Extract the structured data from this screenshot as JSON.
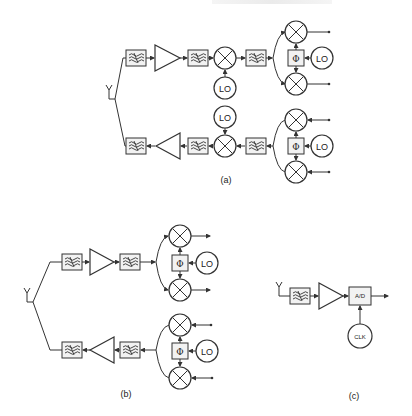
{
  "header_fragment": "",
  "figures": {
    "a": {
      "caption": "(a)",
      "upper_chain": [
        "antenna",
        "bandpass-filter",
        "amplifier",
        "bandpass-filter",
        "mixer",
        "bandpass-filter",
        "iq-splitter"
      ],
      "lower_chain": [
        "iq-combiner",
        "bandpass-filter",
        "mixer",
        "bandpass-filter",
        "amplifier",
        "bandpass-filter",
        "antenna"
      ],
      "lo_label": "LO",
      "phase_label": "Φ"
    },
    "b": {
      "caption": "(b)",
      "upper_chain": [
        "antenna",
        "bandpass-filter",
        "amplifier",
        "bandpass-filter",
        "iq-splitter"
      ],
      "lower_chain": [
        "iq-combiner",
        "bandpass-filter",
        "amplifier",
        "bandpass-filter",
        "antenna"
      ],
      "lo_label": "LO",
      "phase_label": "Φ"
    },
    "c": {
      "caption": "(c)",
      "chain": [
        "antenna",
        "bandpass-filter",
        "amplifier",
        "a-d-converter"
      ],
      "adc_label": "A/D",
      "clock_label": "CLK"
    }
  }
}
